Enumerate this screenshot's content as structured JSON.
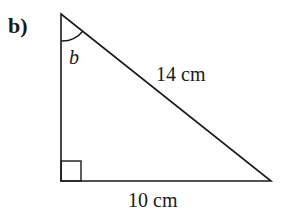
{
  "part_label": "b)",
  "angle_label": "b",
  "hypotenuse_label": "14 cm",
  "base_label": "10 cm",
  "triangle": {
    "top": [
      61,
      14
    ],
    "right_angle": [
      61,
      181
    ],
    "bottom_right": [
      271,
      181
    ]
  },
  "colors": {
    "stroke": "#1a1a1a",
    "background": "#ffffff"
  }
}
